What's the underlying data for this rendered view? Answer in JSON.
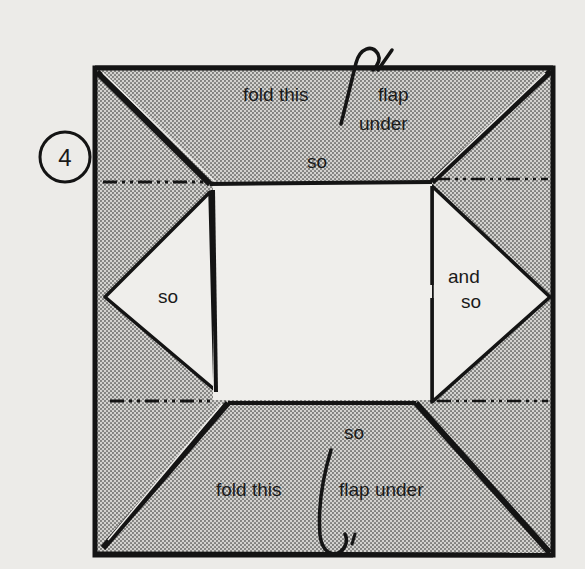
{
  "diagram": {
    "step_number": "4",
    "colors": {
      "background": "#ecebe8",
      "paper_white": "#efeeeb",
      "shaded": "#b9b8b5",
      "ink": "#141414"
    },
    "labels": {
      "top_fold_left": "fold this",
      "top_fold_right_1": "flap",
      "top_fold_right_2": "under",
      "top_so": "so",
      "left_so": "so",
      "right_and": "and",
      "right_so": "so",
      "bottom_so": "so",
      "bottom_fold_left": "fold this",
      "bottom_fold_right": "flap under"
    },
    "regions": [
      "top-flap",
      "bottom-flap",
      "left-triangle-flap",
      "right-triangle-flap",
      "center-square"
    ],
    "lines": [
      "top-dash-dot-fold-line",
      "bottom-dash-dot-fold-line"
    ],
    "arrows": [
      "top-fold-under-arrow",
      "bottom-fold-under-arrow"
    ]
  }
}
